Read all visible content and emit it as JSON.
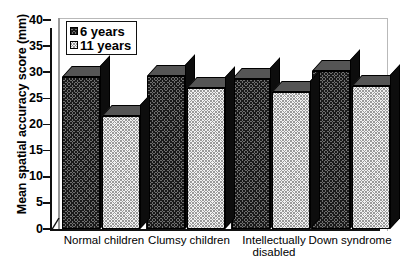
{
  "chart_data": {
    "type": "bar",
    "title": "",
    "xlabel": "",
    "ylabel": "Mean spatial accuracy score (mm)",
    "ylim": [
      0,
      40
    ],
    "yticks": [
      0,
      5,
      10,
      15,
      20,
      25,
      30,
      35,
      40
    ],
    "ytick_labels": [
      "0",
      "5",
      "10",
      "15",
      "20",
      "25",
      "30",
      "35",
      "40"
    ],
    "grid": false,
    "legend_position": "top-left",
    "categories": [
      "Normal children",
      "Clumsy children",
      "Intellectually disabled",
      "Down syndrome"
    ],
    "category_lines": [
      [
        "Normal children"
      ],
      [
        "Clumsy children"
      ],
      [
        "Intellectually",
        "disabled"
      ],
      [
        "Down syndrome"
      ]
    ],
    "series": [
      {
        "name": "6 years",
        "pattern": "dark-hatched",
        "values": [
          29.0,
          29.2,
          28.8,
          30.3
        ]
      },
      {
        "name": "11 years",
        "pattern": "light-dotted",
        "values": [
          21.7,
          27.0,
          26.2,
          27.4
        ]
      }
    ]
  },
  "legend": {
    "items": [
      {
        "label": "6 years",
        "swatch": "dark-hatched-swatch"
      },
      {
        "label": "11 years",
        "swatch": "light-dotted-swatch"
      }
    ]
  },
  "axis": {
    "y_title": "Mean spatial accuracy score (mm)"
  }
}
